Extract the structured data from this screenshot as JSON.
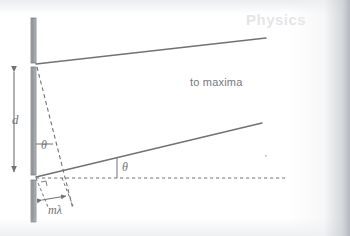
{
  "figure": {
    "background_color": "#ffffff",
    "ink_color": "#6f7276",
    "barrier_fill_color": "#9a9da1",
    "watermark_text": "Physics",
    "labels": {
      "to_maxima": "to maxima",
      "slit_separation": "d",
      "angle_upper": "θ",
      "angle_lower": "θ",
      "path_difference": "mλ"
    },
    "icons": {
      "barrier": "barrier-bar-icon",
      "ray": "ray-line-icon",
      "axis": "dashed-axis-icon",
      "dimension": "dimension-arrow-icon"
    },
    "elements": {
      "barrier_top": {
        "x": 31,
        "y": 18,
        "width": 5,
        "height": 45
      },
      "barrier_middle": {
        "x": 31,
        "y": 67,
        "width": 5,
        "height": 108
      },
      "barrier_bottom": {
        "x": 31,
        "y": 180,
        "width": 5,
        "height": 42
      },
      "ray_upper": {
        "x1": 36,
        "y1": 64,
        "x2": 266,
        "y2": 38
      },
      "ray_lower": {
        "x1": 36,
        "y1": 177,
        "x2": 262,
        "y2": 123
      },
      "axis_dashed": {
        "x1": 36,
        "y1": 178,
        "x2": 287,
        "y2": 178
      },
      "dimension_d": {
        "x": 14,
        "y1": 68,
        "y2": 176
      },
      "path_difference_arrow": {
        "x1": 40,
        "y1": 199,
        "x2": 64,
        "y2": 196
      }
    },
    "annotations": [
      "Upper slit emits a ray toward the interference maximum",
      "Lower slit emits a parallel ray at angle theta from the axis",
      "Slit separation labelled d between the two slits",
      "Path difference m-lambda marked at the lower slit"
    ]
  }
}
